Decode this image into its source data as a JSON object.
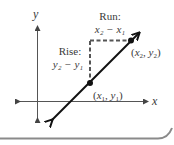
{
  "diagram": {
    "axes": {
      "x_label": "x",
      "y_label": "y"
    },
    "points": [
      {
        "id": "p1",
        "label": "(x₁, y₁)",
        "x_sub": "1",
        "y_sub": "1"
      },
      {
        "id": "p2",
        "label": "(x₂, y₂)",
        "x_sub": "2",
        "y_sub": "2"
      }
    ],
    "run": {
      "title": "Run:",
      "expression": "x₂ − x₁"
    },
    "rise": {
      "title": "Rise:",
      "expression": "y₂ − y₁"
    },
    "colors": {
      "line": "#111111",
      "axis": "#555555",
      "dashed": "#555555",
      "text": "#3a3a3a",
      "border": "#8a8a8a"
    }
  }
}
